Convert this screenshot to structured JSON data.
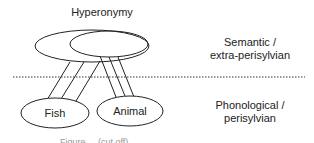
{
  "diagram": {
    "title": "Hyperonymy",
    "levels": [
      {
        "label_line1": "Semantic /",
        "label_line2": "extra-perisylvian"
      },
      {
        "label_line1": "Phonological /",
        "label_line2": "perisylvian"
      }
    ],
    "nodes": [
      {
        "id": "fish",
        "label": "Fish"
      },
      {
        "id": "animal",
        "label": "Animal"
      }
    ],
    "caption": "Figure ... (cut off)"
  },
  "colors": {
    "stroke": "#222222",
    "background": "#ffffff"
  }
}
